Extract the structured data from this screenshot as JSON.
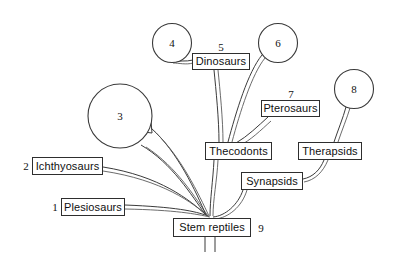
{
  "diagram": {
    "type": "phylogenetic-tree",
    "background_color": "#ffffff",
    "line_color": "#3b3b3b",
    "box_border_color": "#2e2e2e",
    "text_color": "#101010"
  },
  "taxa": [
    {
      "id": "ichthyosaurs",
      "label": "Ichthyosaurs",
      "ref": "2",
      "box": {
        "x": 32,
        "y": 157,
        "w": 71,
        "h": 18
      },
      "ref_pos": {
        "x": 19,
        "y": 160
      }
    },
    {
      "id": "plesiosaurs",
      "label": "Plesiosaurs",
      "ref": "1",
      "box": {
        "x": 61,
        "y": 198,
        "w": 64,
        "h": 18
      },
      "ref_pos": {
        "x": 48,
        "y": 201
      }
    },
    {
      "id": "dinosaurs",
      "label": "Dinosaurs",
      "ref": "5",
      "box": {
        "x": 192,
        "y": 53,
        "w": 58,
        "h": 17
      },
      "ref_pos": {
        "x": 214,
        "y": 41
      }
    },
    {
      "id": "pterosaurs",
      "label": "Pterosaurs",
      "ref": "7",
      "box": {
        "x": 261,
        "y": 100,
        "w": 59,
        "h": 17
      },
      "ref_pos": {
        "x": 284,
        "y": 88
      }
    },
    {
      "id": "thecodonts",
      "label": "Thecodonts",
      "ref": "",
      "box": {
        "x": 205,
        "y": 142,
        "w": 67,
        "h": 18
      },
      "ref_pos": null
    },
    {
      "id": "therapsids",
      "label": "Therapsids",
      "ref": "",
      "box": {
        "x": 298,
        "y": 142,
        "w": 64,
        "h": 18
      },
      "ref_pos": null
    },
    {
      "id": "synapsids",
      "label": "Synapsids",
      "ref": "",
      "box": {
        "x": 241,
        "y": 172,
        "w": 62,
        "h": 18
      },
      "ref_pos": null
    },
    {
      "id": "stem-reptiles",
      "label": "Stem reptiles",
      "ref": "9",
      "box": {
        "x": 173,
        "y": 218,
        "w": 78,
        "h": 19
      },
      "ref_pos": {
        "x": 254,
        "y": 222
      }
    }
  ],
  "circle_nodes": [
    {
      "id": "node-3",
      "label": "3",
      "cx": 120,
      "cy": 116,
      "r": 32
    },
    {
      "id": "node-4",
      "label": "4",
      "cx": 172,
      "cy": 43,
      "r": 19.5
    },
    {
      "id": "node-6",
      "label": "6",
      "cx": 278,
      "cy": 43,
      "r": 19.5
    },
    {
      "id": "node-8",
      "label": "8",
      "cx": 354,
      "cy": 89,
      "r": 19.5
    }
  ],
  "connections": [
    {
      "from": "stem-reptiles",
      "to": "plesiosaurs"
    },
    {
      "from": "stem-reptiles",
      "to": "ichthyosaurs"
    },
    {
      "from": "stem-reptiles",
      "to": "node-3"
    },
    {
      "from": "stem-reptiles",
      "to": "thecodonts"
    },
    {
      "from": "stem-reptiles",
      "to": "synapsids"
    },
    {
      "from": "thecodonts",
      "to": "dinosaurs"
    },
    {
      "from": "thecodonts",
      "to": "node-6"
    },
    {
      "from": "thecodonts",
      "to": "pterosaurs"
    },
    {
      "from": "dinosaurs",
      "to": "node-4"
    },
    {
      "from": "synapsids",
      "to": "therapsids"
    },
    {
      "from": "therapsids",
      "to": "node-8"
    }
  ]
}
